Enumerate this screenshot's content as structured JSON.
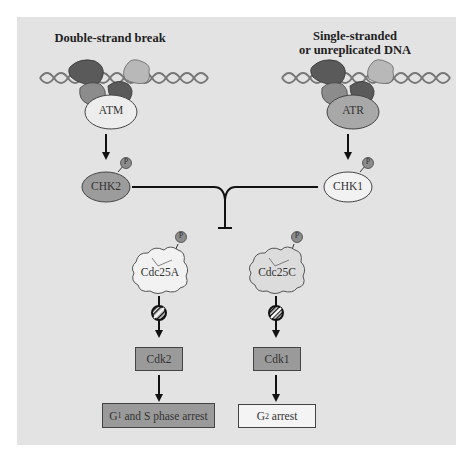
{
  "diagram": {
    "left_branch": {
      "title": "Double-strand break",
      "sensor": "ATM",
      "kinase": "CHK2"
    },
    "right_branch": {
      "title_line1": "Single-stranded",
      "title_line2": "or unreplicated DNA",
      "sensor": "ATR",
      "kinase": "CHK1"
    },
    "phosphatases": [
      "Cdc25A",
      "Cdc25C"
    ],
    "cdks": [
      "Cdk2",
      "Cdk1"
    ],
    "outcomes": [
      {
        "prefix": "G",
        "sub": "1",
        "suffix": " and S phase arrest"
      },
      {
        "prefix": "G",
        "sub": "2",
        "suffix": " arrest"
      }
    ],
    "phospho_label": "P",
    "colors": {
      "background": "#e3e3e3",
      "chk2_fill": "#9c9c9c",
      "chk1_fill": "#f2f2f2",
      "atm_fill": "#ededed",
      "atr_fill": "#a8a8a8",
      "cdk_fill": "#9a9a9a",
      "g1s_fill": "#9a9a9a",
      "g2_fill": "#f4f4f4",
      "dark_protein": "#5a5a5a",
      "mid_protein": "#8c8c8c",
      "light_protein": "#b8b8b8"
    }
  }
}
